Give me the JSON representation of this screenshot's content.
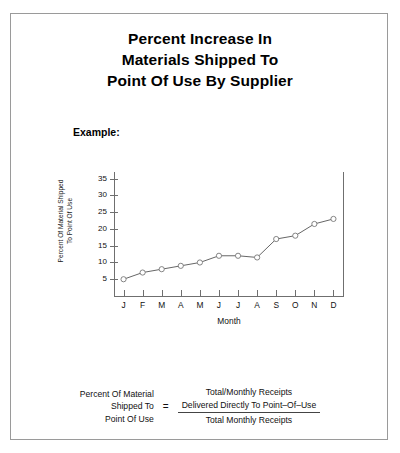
{
  "title": {
    "line1": "Percent Increase In",
    "line2": "Materials Shipped To",
    "line3": "Point Of Use By Supplier"
  },
  "example_label": "Example:",
  "chart_data": {
    "type": "line",
    "title": "Percent Increase In Materials Shipped To Point Of Use By Supplier",
    "xlabel": "Month",
    "ylabel_line1": "Percent Of Material Shipped",
    "ylabel_line2": "To Point Of Use",
    "categories": [
      "J",
      "F",
      "M",
      "A",
      "M",
      "J",
      "J",
      "A",
      "S",
      "O",
      "N",
      "D"
    ],
    "values": [
      5,
      7,
      8,
      9,
      10,
      12,
      12,
      11.5,
      17,
      18,
      21.5,
      23
    ],
    "ylim": [
      0,
      37
    ],
    "yticks": [
      5,
      10,
      15,
      20,
      25,
      30,
      35
    ],
    "grid": false,
    "legend": "none",
    "marker": "open-circle",
    "line_color": "#555555",
    "marker_color": "#777777"
  },
  "formula": {
    "left_line1": "Percent Of Material",
    "left_line2": "Shipped To",
    "left_line3": "Point Of Use",
    "equals": "=",
    "numerator_line1": "Total/Monthly Receipts",
    "numerator_line2": "Delivered Directly To Point–Of–Use",
    "denominator": "Total Monthly Receipts"
  },
  "colors": {
    "border": "#9a9a9a",
    "axis": "#6f6f6f",
    "text": "#111111"
  }
}
